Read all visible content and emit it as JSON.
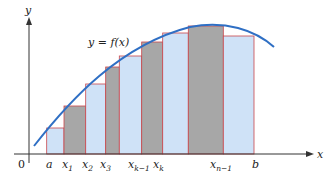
{
  "figure": {
    "title": "",
    "curve_label": "y = f(x)",
    "y_axis_label": "y",
    "x_axis_label": "x",
    "origin_label": "0",
    "colors": {
      "curve": "#2f6fc4",
      "light_bar": "#cfe2f7",
      "dark_bar": "#a7a7a7",
      "bar_outline": "#c8464c",
      "axis": "#333333"
    },
    "tick_labels": [
      {
        "base": "a",
        "sub": ""
      },
      {
        "base": "x",
        "sub": "1"
      },
      {
        "base": "x",
        "sub": "2"
      },
      {
        "base": "x",
        "sub": "3"
      },
      {
        "base": "x",
        "sub": "k−1"
      },
      {
        "base": "x",
        "sub": "k"
      },
      {
        "base": "x",
        "sub": "n−1"
      },
      {
        "base": "b",
        "sub": ""
      }
    ]
  },
  "chart_data": {
    "type": "bar",
    "title": "",
    "xlabel": "x",
    "ylabel": "y",
    "curve": "y = f(x), concave-down, increasing then slightly decreasing",
    "categories": [
      "[a,x1]",
      "[x1,x2]",
      "[x2,x3]",
      "[x3,x4]",
      "[x4,x_k-1]",
      "[x_k-1,x_k]",
      "[x_k,x_n-1 start]",
      "[.. ,x_n-1]",
      "[x_n-1,b]"
    ],
    "x_edges_px": [
      46.7,
      64,
      85.7,
      105.7,
      119.3,
      141.7,
      162.7,
      188.3,
      223.3,
      254
    ],
    "values_px_height": [
      26,
      48,
      70,
      87,
      98,
      112,
      121,
      128,
      118
    ],
    "fills": [
      "light",
      "dark",
      "light",
      "dark",
      "light",
      "dark",
      "light",
      "dark",
      "light"
    ]
  }
}
